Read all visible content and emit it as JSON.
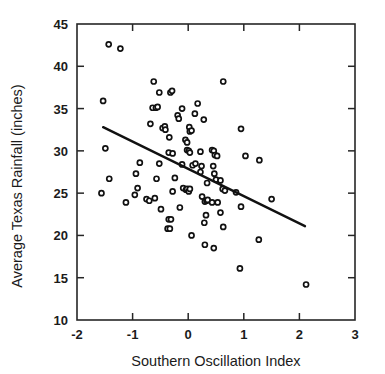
{
  "chart_data": {
    "type": "scatter",
    "title": "",
    "xlabel": "Southern Oscillation Index",
    "ylabel": "Average Texas Rainfall (inches)",
    "xlim": [
      -2,
      3
    ],
    "ylim": [
      10,
      45
    ],
    "xticks": [
      -2,
      -1,
      0,
      1,
      2,
      3
    ],
    "yticks": [
      10,
      15,
      20,
      25,
      30,
      35,
      40,
      45
    ],
    "xtick_labels": [
      "-2",
      "-1",
      "0",
      "1",
      "2",
      "3"
    ],
    "ytick_labels": [
      "10",
      "15",
      "20",
      "25",
      "30",
      "35",
      "40",
      "45"
    ],
    "grid": false,
    "legend": null,
    "marker": "open-circle",
    "point_color": "#111111",
    "line_color": "#111111",
    "trendline": {
      "type": "linear-fit",
      "x_start": -1.53,
      "y_start": 32.8,
      "x_end": 2.1,
      "y_end": 21.1,
      "slope": -3.22,
      "intercept": 27.87
    },
    "points": [
      [
        -1.43,
        42.6
      ],
      [
        -1.22,
        42.1
      ],
      [
        -0.62,
        38.2
      ],
      [
        0.63,
        38.2
      ],
      [
        -1.53,
        35.9
      ],
      [
        -0.52,
        36.9
      ],
      [
        -0.32,
        36.9
      ],
      [
        -0.29,
        37.1
      ],
      [
        -0.64,
        35.1
      ],
      [
        -0.58,
        35.1
      ],
      [
        -0.55,
        35.2
      ],
      [
        -0.11,
        35.0
      ],
      [
        0.17,
        35.6
      ],
      [
        -0.19,
        34.2
      ],
      [
        -0.17,
        33.8
      ],
      [
        0.12,
        34.4
      ],
      [
        0.28,
        33.7
      ],
      [
        -0.68,
        33.2
      ],
      [
        -0.46,
        32.7
      ],
      [
        -0.42,
        32.9
      ],
      [
        -0.41,
        32.5
      ],
      [
        0.02,
        32.8
      ],
      [
        0.03,
        32.3
      ],
      [
        0.06,
        32.4
      ],
      [
        0.95,
        32.6
      ],
      [
        -0.34,
        31.6
      ],
      [
        -0.05,
        31.3
      ],
      [
        -0.02,
        31.0
      ],
      [
        -1.49,
        30.3
      ],
      [
        -0.35,
        29.8
      ],
      [
        -0.28,
        29.7
      ],
      [
        -0.02,
        30.1
      ],
      [
        0.01,
        30.0
      ],
      [
        0.03,
        29.8
      ],
      [
        0.22,
        29.9
      ],
      [
        0.43,
        30.1
      ],
      [
        0.46,
        30.0
      ],
      [
        0.48,
        29.5
      ],
      [
        0.52,
        29.4
      ],
      [
        1.03,
        29.4
      ],
      [
        1.28,
        28.9
      ],
      [
        -0.87,
        28.6
      ],
      [
        -0.52,
        28.5
      ],
      [
        -0.11,
        28.4
      ],
      [
        0.08,
        28.3
      ],
      [
        0.13,
        28.5
      ],
      [
        0.24,
        28.2
      ],
      [
        0.45,
        28.2
      ],
      [
        0.22,
        27.5
      ],
      [
        0.47,
        27.3
      ],
      [
        -0.94,
        27.3
      ],
      [
        -0.57,
        26.7
      ],
      [
        -0.24,
        26.8
      ],
      [
        0.34,
        26.2
      ],
      [
        0.5,
        26.6
      ],
      [
        0.58,
        26.5
      ],
      [
        -1.42,
        26.7
      ],
      [
        -0.91,
        25.6
      ],
      [
        -0.28,
        25.2
      ],
      [
        -0.09,
        25.6
      ],
      [
        -0.04,
        25.4
      ],
      [
        -0.02,
        25.5
      ],
      [
        0.01,
        25.2
      ],
      [
        0.03,
        25.5
      ],
      [
        0.62,
        25.5
      ],
      [
        0.66,
        25.3
      ],
      [
        0.86,
        25.1
      ],
      [
        -1.56,
        25.0
      ],
      [
        -0.96,
        24.8
      ],
      [
        -0.75,
        24.3
      ],
      [
        -0.7,
        24.1
      ],
      [
        -0.6,
        24.4
      ],
      [
        0.25,
        24.6
      ],
      [
        0.3,
        24.0
      ],
      [
        0.33,
        24.1
      ],
      [
        0.35,
        24.2
      ],
      [
        0.43,
        23.9
      ],
      [
        0.53,
        23.9
      ],
      [
        1.5,
        24.3
      ],
      [
        -1.12,
        23.9
      ],
      [
        -0.49,
        23.1
      ],
      [
        -0.15,
        23.3
      ],
      [
        0.32,
        22.4
      ],
      [
        0.58,
        22.7
      ],
      [
        0.95,
        23.4
      ],
      [
        -0.35,
        21.9
      ],
      [
        -0.31,
        21.9
      ],
      [
        0.29,
        21.5
      ],
      [
        0.63,
        21.0
      ],
      [
        -0.37,
        20.8
      ],
      [
        -0.33,
        20.8
      ],
      [
        0.06,
        20.0
      ],
      [
        0.3,
        18.9
      ],
      [
        0.46,
        18.5
      ],
      [
        1.27,
        19.5
      ],
      [
        0.93,
        16.1
      ],
      [
        2.12,
        14.2
      ]
    ]
  }
}
